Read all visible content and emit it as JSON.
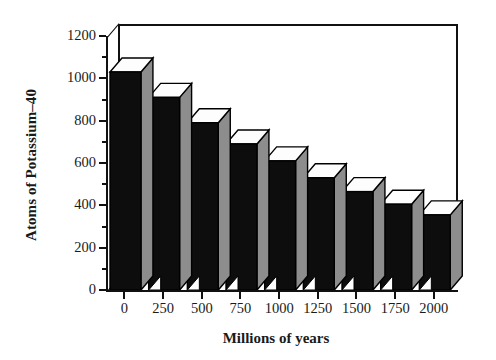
{
  "chart_data": {
    "type": "bar",
    "title": "",
    "subtitle": "",
    "xlabel": "Millions of years",
    "ylabel": "Atoms of Potassium–40",
    "categories": [
      "0",
      "250",
      "500",
      "750",
      "1000",
      "1250",
      "1500",
      "1750",
      "2000"
    ],
    "values": [
      1030,
      910,
      790,
      690,
      610,
      530,
      465,
      405,
      355
    ],
    "xlim": [
      0,
      2000
    ],
    "ylim": [
      0,
      1200
    ],
    "ytick_labels": [
      "0",
      "200",
      "400",
      "600",
      "800",
      "1000",
      "1200"
    ],
    "ytick_values": [
      0,
      200,
      400,
      600,
      800,
      1000,
      1200
    ],
    "yminor_ticks": [
      100,
      300,
      500,
      700,
      900,
      1100
    ],
    "xtick_labels": [
      "0",
      "250",
      "500",
      "750",
      "1000",
      "1250",
      "1500",
      "1750",
      "2000"
    ],
    "xtick_values": [
      0,
      250,
      500,
      750,
      1000,
      1250,
      1500,
      1750,
      2000
    ],
    "grid": false,
    "legend": null,
    "legend_position": "none",
    "style": "3d-column",
    "annotations": []
  },
  "colors": {
    "bar_front": "#0d0d0d",
    "bar_top": "#fdfdfd",
    "bar_side": "#8d8d8d",
    "axis": "#111111",
    "background": "#ffffff",
    "text": "#1a1a1a"
  }
}
